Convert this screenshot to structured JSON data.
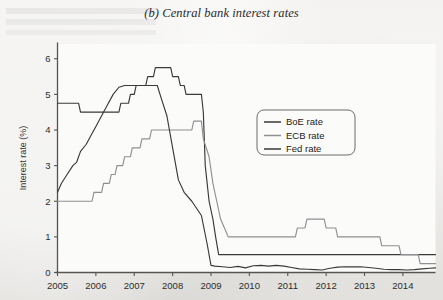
{
  "figure": {
    "title": "(b) Central bank interest rates"
  },
  "chart_data": {
    "type": "line",
    "title": "(b) Central bank interest rates",
    "xlabel": "",
    "ylabel": "Interest rate (%)",
    "xlim": [
      2005.0,
      2014.85
    ],
    "ylim": [
      0,
      6.4
    ],
    "grid": false,
    "legend_position": "center-right-inside",
    "y_ticks": [
      0,
      1,
      2,
      3,
      4,
      5,
      6
    ],
    "y_tick_labels": [
      "0",
      "1",
      "2",
      "3",
      "4",
      "5",
      "6"
    ],
    "x_ticks": [
      2005,
      2006,
      2007,
      2008,
      2009,
      2010,
      2011,
      2012,
      2013,
      2014
    ],
    "x_tick_labels": [
      "2005",
      "2006",
      "2007",
      "2008",
      "2009",
      "2010",
      "2011",
      "2012",
      "2013",
      "2014"
    ],
    "series": [
      {
        "name": "BoE rate",
        "color": "#3a3a38",
        "width": 1.15,
        "points": [
          [
            2005.0,
            4.75
          ],
          [
            2005.55,
            4.75
          ],
          [
            2005.6,
            4.5
          ],
          [
            2006.6,
            4.5
          ],
          [
            2006.65,
            4.75
          ],
          [
            2006.85,
            4.75
          ],
          [
            2006.9,
            5.0
          ],
          [
            2007.0,
            5.0
          ],
          [
            2007.05,
            5.25
          ],
          [
            2007.3,
            5.25
          ],
          [
            2007.35,
            5.5
          ],
          [
            2007.5,
            5.5
          ],
          [
            2007.55,
            5.75
          ],
          [
            2007.95,
            5.75
          ],
          [
            2008.0,
            5.5
          ],
          [
            2008.15,
            5.5
          ],
          [
            2008.2,
            5.25
          ],
          [
            2008.3,
            5.25
          ],
          [
            2008.35,
            5.0
          ],
          [
            2008.75,
            5.0
          ],
          [
            2008.8,
            4.5
          ],
          [
            2008.85,
            3.0
          ],
          [
            2008.95,
            2.0
          ],
          [
            2009.05,
            1.5
          ],
          [
            2009.12,
            1.0
          ],
          [
            2009.2,
            0.5
          ],
          [
            2014.85,
            0.5
          ]
        ]
      },
      {
        "name": "ECB rate",
        "color": "#8f9093",
        "width": 1.15,
        "points": [
          [
            2005.0,
            2.0
          ],
          [
            2005.9,
            2.0
          ],
          [
            2005.95,
            2.25
          ],
          [
            2006.15,
            2.25
          ],
          [
            2006.2,
            2.5
          ],
          [
            2006.35,
            2.5
          ],
          [
            2006.4,
            2.75
          ],
          [
            2006.5,
            2.75
          ],
          [
            2006.55,
            3.0
          ],
          [
            2006.7,
            3.0
          ],
          [
            2006.75,
            3.25
          ],
          [
            2006.9,
            3.25
          ],
          [
            2006.95,
            3.5
          ],
          [
            2007.15,
            3.5
          ],
          [
            2007.2,
            3.75
          ],
          [
            2007.4,
            3.75
          ],
          [
            2007.45,
            4.0
          ],
          [
            2008.5,
            4.0
          ],
          [
            2008.55,
            4.25
          ],
          [
            2008.75,
            4.25
          ],
          [
            2008.8,
            3.75
          ],
          [
            2008.95,
            3.25
          ],
          [
            2009.05,
            2.5
          ],
          [
            2009.15,
            2.0
          ],
          [
            2009.25,
            1.5
          ],
          [
            2009.35,
            1.25
          ],
          [
            2009.45,
            1.0
          ],
          [
            2011.2,
            1.0
          ],
          [
            2011.25,
            1.25
          ],
          [
            2011.45,
            1.25
          ],
          [
            2011.5,
            1.5
          ],
          [
            2011.95,
            1.5
          ],
          [
            2012.0,
            1.25
          ],
          [
            2012.25,
            1.25
          ],
          [
            2012.3,
            1.0
          ],
          [
            2013.4,
            1.0
          ],
          [
            2013.45,
            0.75
          ],
          [
            2013.9,
            0.75
          ],
          [
            2013.95,
            0.5
          ],
          [
            2014.4,
            0.5
          ],
          [
            2014.45,
            0.25
          ],
          [
            2014.85,
            0.25
          ]
        ]
      },
      {
        "name": "Fed rate",
        "color": "#3a3a38",
        "width": 1.15,
        "points": [
          [
            2005.0,
            2.25
          ],
          [
            2005.1,
            2.5
          ],
          [
            2005.25,
            2.75
          ],
          [
            2005.4,
            3.0
          ],
          [
            2005.5,
            3.1
          ],
          [
            2005.6,
            3.4
          ],
          [
            2005.75,
            3.6
          ],
          [
            2005.9,
            3.9
          ],
          [
            2006.0,
            4.1
          ],
          [
            2006.15,
            4.4
          ],
          [
            2006.3,
            4.7
          ],
          [
            2006.45,
            5.0
          ],
          [
            2006.6,
            5.2
          ],
          [
            2006.75,
            5.25
          ],
          [
            2007.6,
            5.25
          ],
          [
            2007.7,
            4.9
          ],
          [
            2007.85,
            4.4
          ],
          [
            2008.0,
            3.5
          ],
          [
            2008.15,
            2.6
          ],
          [
            2008.3,
            2.25
          ],
          [
            2008.5,
            2.0
          ],
          [
            2008.75,
            1.6
          ],
          [
            2008.9,
            0.8
          ],
          [
            2009.0,
            0.2
          ],
          [
            2009.1,
            0.18
          ],
          [
            2009.3,
            0.16
          ],
          [
            2009.5,
            0.14
          ],
          [
            2009.7,
            0.17
          ],
          [
            2009.9,
            0.13
          ],
          [
            2010.1,
            0.19
          ],
          [
            2010.3,
            0.2
          ],
          [
            2010.5,
            0.18
          ],
          [
            2010.7,
            0.2
          ],
          [
            2010.9,
            0.18
          ],
          [
            2011.1,
            0.14
          ],
          [
            2011.3,
            0.1
          ],
          [
            2011.5,
            0.09
          ],
          [
            2011.7,
            0.08
          ],
          [
            2011.9,
            0.07
          ],
          [
            2012.1,
            0.12
          ],
          [
            2012.3,
            0.15
          ],
          [
            2012.5,
            0.16
          ],
          [
            2012.7,
            0.16
          ],
          [
            2012.9,
            0.16
          ],
          [
            2013.1,
            0.14
          ],
          [
            2013.3,
            0.12
          ],
          [
            2013.5,
            0.09
          ],
          [
            2013.7,
            0.08
          ],
          [
            2013.9,
            0.08
          ],
          [
            2014.1,
            0.07
          ],
          [
            2014.3,
            0.08
          ],
          [
            2014.5,
            0.1
          ],
          [
            2014.7,
            0.12
          ],
          [
            2014.85,
            0.13
          ]
        ]
      }
    ]
  },
  "legend": {
    "items": [
      {
        "label": "BoE rate",
        "color": "#3a3a38"
      },
      {
        "label": "ECB rate",
        "color": "#8f9093"
      },
      {
        "label": "Fed rate",
        "color": "#3a3a38"
      }
    ]
  }
}
